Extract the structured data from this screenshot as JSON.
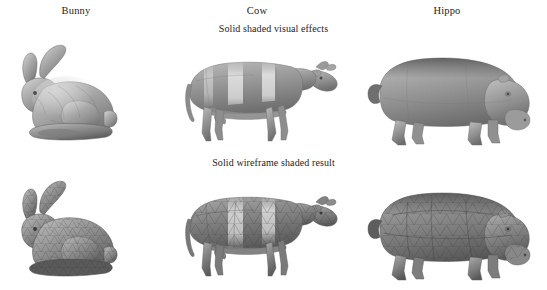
{
  "figure": {
    "background_color": "#ffffff",
    "ink_color": "#1d1d1d",
    "columns": [
      {
        "id": "bunny",
        "label": "Bunny"
      },
      {
        "id": "cow",
        "label": "Cow"
      },
      {
        "id": "hippo",
        "label": "Hippo"
      }
    ],
    "rows": [
      {
        "id": "solid",
        "caption": "Solid shaded visual effects"
      },
      {
        "id": "wireframe",
        "caption": "Solid wireframe shaded result"
      }
    ],
    "cells": [
      {
        "row": "solid",
        "column": "bunny",
        "model": "stanford-bunny",
        "rendering": "solid-shaded",
        "shading": "grayscale"
      },
      {
        "row": "solid",
        "column": "cow",
        "model": "cow",
        "rendering": "solid-shaded",
        "shading": "grayscale"
      },
      {
        "row": "solid",
        "column": "hippo",
        "model": "hippo",
        "rendering": "solid-shaded",
        "shading": "grayscale"
      },
      {
        "row": "wireframe",
        "column": "bunny",
        "model": "stanford-bunny",
        "rendering": "solid-wireframe-shaded",
        "shading": "grayscale"
      },
      {
        "row": "wireframe",
        "column": "cow",
        "model": "cow",
        "rendering": "solid-wireframe-shaded",
        "shading": "grayscale"
      },
      {
        "row": "wireframe",
        "column": "hippo",
        "model": "hippo",
        "rendering": "solid-wireframe-shaded",
        "shading": "grayscale"
      }
    ]
  }
}
